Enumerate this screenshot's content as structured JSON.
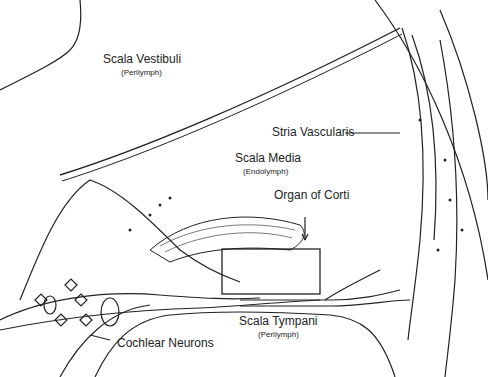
{
  "diagram": {
    "labels": {
      "scala_vestibuli": {
        "title": "Scala Vestibuli",
        "fluid": "(Perilymph)"
      },
      "scala_media": {
        "title": "Scala Media",
        "fluid": "(Endolymph)"
      },
      "scala_tympani": {
        "title": "Scala Tympani",
        "fluid": "(Perilymph)"
      },
      "stria_vascularis": "Stria Vascularis",
      "organ_of_corti": "Organ of Corti",
      "cochlear_neurons": "Cochlear Neurons"
    },
    "colors": {
      "line": "#222222",
      "background": "#ffffff"
    }
  }
}
